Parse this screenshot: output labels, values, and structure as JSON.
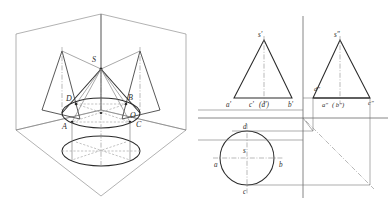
{
  "figure": {
    "colors": {
      "outline": "#2b2b2b",
      "thin": "#6e6e6e",
      "hidden": "#8a8a8a",
      "center": "#7a7a7a",
      "background": "#ffffff"
    }
  },
  "pictorial": {
    "name": "isometric-projection-box",
    "labels": {
      "apex": "S",
      "center": "O",
      "point_a": "A",
      "point_b": "B",
      "point_c": "C",
      "point_d": "D"
    }
  },
  "front_view": {
    "name": "front-view",
    "labels": {
      "apex": "s'",
      "left": "a'",
      "center": "c'",
      "center_hidden": "(d')",
      "right": "b'"
    }
  },
  "side_view": {
    "name": "side-view",
    "labels": {
      "apex": "s″",
      "upper_left": "d″",
      "left": "a″",
      "hidden": "( b″)",
      "right": "c″"
    }
  },
  "top_view": {
    "name": "top-view",
    "labels": {
      "center": "s",
      "top": "d",
      "bottom": "c",
      "left": "a",
      "right": "b"
    }
  }
}
